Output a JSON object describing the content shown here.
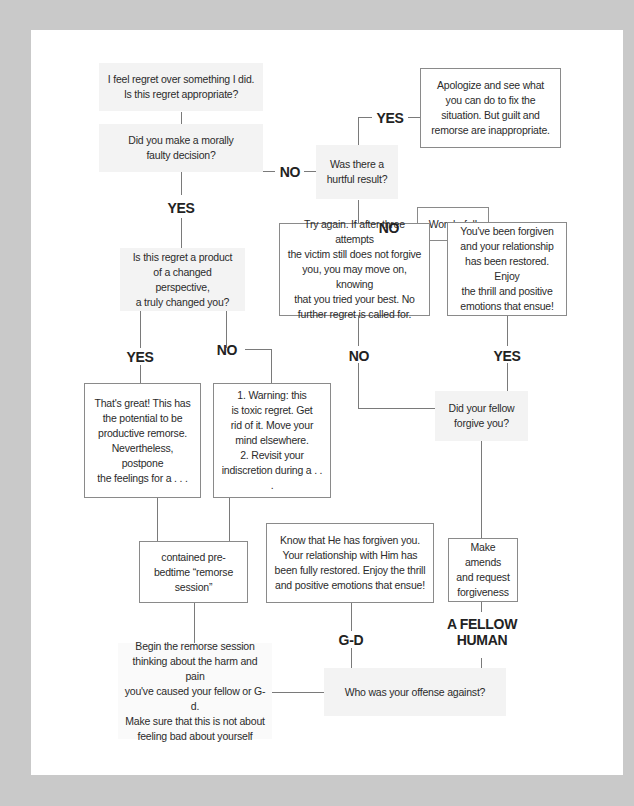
{
  "diagram": {
    "type": "flowchart",
    "nodes": {
      "start": "I feel regret over something I did. Is this regret appropriate?",
      "q_moral": "Did you make a morally faulty decision?",
      "q_hurtful": "Was there a hurtful result?",
      "a_apologize": "Apologize and see what you can do to fix the situation. But guilt and remorse are inappropriate.",
      "a_wonderful": "Wonderful!",
      "q_changed": "Is this regret a product of a changed perspective, a truly changed you?",
      "a_try_again": "Try again. If after three attempts the victim still does not forgive you, you may move on, knowing that you tried your best. No further regret is called for.",
      "a_forgiven": "You've been forgiven and your relationship has been restored. Enjoy the thrill and positive emotions that ensue!",
      "a_great": "That's great! This has the potential to be productive remorse. Nevertheless, postpone the feelings for a . . .",
      "a_warning": "1. Warning: this is toxic regret. Get rid of it. Move your mind elsewhere. 2. Revisit your indiscretion during a . . .",
      "q_fellow_forgive": "Did your fellow forgive you?",
      "a_session": "contained pre-bedtime \"remorse session\"",
      "a_god_forgiven": "Know that He has forgiven you. Your relationship with Him has been fully restored. Enjoy the thrill and positive emotions that ensue!",
      "a_amends": "Make amends and request forgiveness",
      "a_begin": "Begin the remorse session thinking about the harm and pain you've caused your fellow or G-d. Make sure that this is not about feeling bad about yourself",
      "q_offense": "Who was your offense against?"
    },
    "lines": {
      "start": [
        "I feel regret over something I did.",
        "Is this regret appropriate?"
      ],
      "q_moral": [
        "Did you make a morally",
        "faulty decision?"
      ],
      "q_hurtful": [
        "Was there a",
        "hurtful result?"
      ],
      "a_apologize": [
        "Apologize and see what",
        "you can do to fix the",
        "situation. But guilt and",
        "remorse are inappropriate."
      ],
      "a_wonderful": [
        "Wonderful!"
      ],
      "q_changed": [
        "Is this regret a product",
        "of a changed perspective,",
        "a truly changed you?"
      ],
      "a_try_again": [
        "Try again. If after three attempts",
        "the victim still does not forgive",
        "you, you may move on, knowing",
        "that you tried your best. No",
        "further regret is called for."
      ],
      "a_forgiven": [
        "You've been forgiven",
        "and your relationship",
        "has been restored. Enjoy",
        "the thrill and positive",
        "emotions that ensue!"
      ],
      "a_great": [
        "That's great! This has",
        "the potential to be",
        "productive remorse.",
        "Nevertheless, postpone",
        "the feelings for a . . ."
      ],
      "a_warning": [
        "1. Warning: this",
        "is toxic regret. Get",
        "rid of it. Move your",
        "mind elsewhere.",
        "2. Revisit your",
        "indiscretion during a . . ."
      ],
      "q_fellow_forgive": [
        "Did your fellow",
        "forgive you?"
      ],
      "a_session": [
        "contained pre-",
        "bedtime “remorse",
        "session”"
      ],
      "a_god_forgiven": [
        "Know that He has forgiven you.",
        "Your relationship with Him has",
        "been fully restored. Enjoy the thrill",
        "and positive emotions that ensue!"
      ],
      "a_amends": [
        "Make amends",
        "and request",
        "forgiveness"
      ],
      "a_begin": [
        "Begin the remorse session",
        "thinking about the harm and pain",
        "you've caused your fellow or G-d.",
        "Make sure that this is not about",
        "feeling bad about yourself"
      ],
      "q_offense": [
        "Who was your offense against?"
      ]
    },
    "labels": {
      "moral_no": "NO",
      "hurtful_yes": "YES",
      "hurtful_no": "NO",
      "moral_yes": "YES",
      "changed_yes": "YES",
      "changed_no": "NO",
      "forgive_no": "NO",
      "forgive_yes": "YES",
      "offense_god": "G-D",
      "offense_human_1": "A FELLOW",
      "offense_human_2": "HUMAN"
    },
    "colors": {
      "background": "#c9c9c9",
      "panel": "#ffffff",
      "question_fill": "#f3f3f3",
      "box_border": "#8a8a8a",
      "connector": "#7a7a7a",
      "text": "#2b2b2b"
    }
  }
}
